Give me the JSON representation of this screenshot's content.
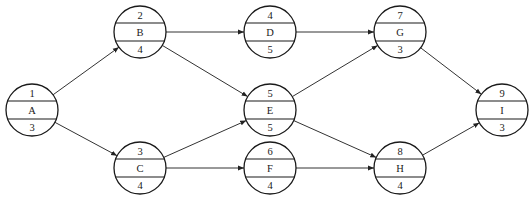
{
  "diagram": {
    "type": "activity-on-node network",
    "node_format": {
      "top": "node number",
      "middle": "activity",
      "bottom": "duration"
    },
    "nodes": [
      {
        "id": "1",
        "activity": "A",
        "duration": "3",
        "cx": 32,
        "cy": 110
      },
      {
        "id": "2",
        "activity": "B",
        "duration": "4",
        "cx": 140,
        "cy": 32
      },
      {
        "id": "3",
        "activity": "C",
        "duration": "4",
        "cx": 140,
        "cy": 168
      },
      {
        "id": "4",
        "activity": "D",
        "duration": "5",
        "cx": 270,
        "cy": 32
      },
      {
        "id": "5",
        "activity": "E",
        "duration": "5",
        "cx": 270,
        "cy": 110
      },
      {
        "id": "6",
        "activity": "F",
        "duration": "4",
        "cx": 270,
        "cy": 168
      },
      {
        "id": "7",
        "activity": "G",
        "duration": "3",
        "cx": 400,
        "cy": 32
      },
      {
        "id": "8",
        "activity": "H",
        "duration": "4",
        "cx": 400,
        "cy": 168
      },
      {
        "id": "9",
        "activity": "I",
        "duration": "3",
        "cx": 502,
        "cy": 110
      }
    ],
    "edges": [
      {
        "from": "1",
        "to": "2"
      },
      {
        "from": "1",
        "to": "3"
      },
      {
        "from": "2",
        "to": "4"
      },
      {
        "from": "2",
        "to": "5"
      },
      {
        "from": "3",
        "to": "5"
      },
      {
        "from": "3",
        "to": "6"
      },
      {
        "from": "4",
        "to": "7"
      },
      {
        "from": "5",
        "to": "7"
      },
      {
        "from": "5",
        "to": "8"
      },
      {
        "from": "6",
        "to": "8"
      },
      {
        "from": "7",
        "to": "9"
      },
      {
        "from": "8",
        "to": "9"
      }
    ],
    "radius": 26,
    "colors": {
      "stroke": "#1a1a1a",
      "edge": "#333333",
      "background": "#ffffff"
    }
  }
}
